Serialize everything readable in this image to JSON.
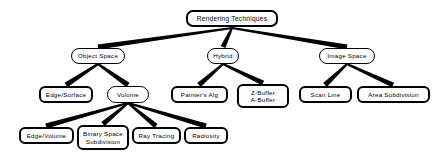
{
  "diagram": {
    "title": "Rendering Techniques",
    "type": "tree-hierarchy",
    "background_color": "#ffffff",
    "node_fill_color": "#ffffff",
    "node_border_color": "#000000",
    "edge_color": "#000000"
  },
  "nodes": {
    "root": {
      "label": "Rendering Techniques",
      "x": 186,
      "y": 10,
      "w": 92,
      "h": 17,
      "level": 0,
      "style": "root"
    },
    "object_space": {
      "label": "Object Space",
      "x": 71,
      "y": 48,
      "w": 54,
      "h": 16,
      "level": 1,
      "style": "thin"
    },
    "hybrid": {
      "label": "Hybrid",
      "x": 207,
      "y": 48,
      "w": 32,
      "h": 16,
      "level": 1,
      "style": "thin"
    },
    "image_space": {
      "label": "Image Space",
      "x": 319,
      "y": 48,
      "w": 56,
      "h": 16,
      "level": 1,
      "style": "thin"
    },
    "edge_surface": {
      "label": "Edge/Surface",
      "x": 39,
      "y": 86,
      "w": 54,
      "h": 17,
      "level": 2,
      "style": "leaf"
    },
    "volume": {
      "label": "Volume",
      "x": 107,
      "y": 86,
      "w": 42,
      "h": 17,
      "level": 2,
      "style": "thin"
    },
    "painters_alg": {
      "label": "Painter's Alg",
      "x": 171,
      "y": 86,
      "w": 57,
      "h": 17,
      "level": 2,
      "style": "leaf"
    },
    "z_buffer": {
      "label": "Z-Buffer\nA-Buffer",
      "x": 237,
      "y": 84,
      "w": 52,
      "h": 24,
      "level": 2,
      "style": "leaf"
    },
    "scan_line": {
      "label": "Scan Line",
      "x": 299,
      "y": 86,
      "w": 53,
      "h": 17,
      "level": 2,
      "style": "leaf"
    },
    "area_subdivision": {
      "label": "Area  Subdivision",
      "x": 357,
      "y": 86,
      "w": 73,
      "h": 17,
      "level": 2,
      "style": "leaf"
    },
    "edge_volume": {
      "label": "Edge/Volume",
      "x": 19,
      "y": 127,
      "w": 55,
      "h": 17,
      "level": 3,
      "style": "leaf"
    },
    "binary_space_subdivision": {
      "label": "Binary  Space\nSubdivision",
      "x": 77,
      "y": 125,
      "w": 52,
      "h": 25,
      "level": 3,
      "style": "leaf"
    },
    "ray_tracing": {
      "label": "Ray  Tracing",
      "x": 132,
      "y": 127,
      "w": 49,
      "h": 17,
      "level": 3,
      "style": "leaf"
    },
    "radiosity": {
      "label": "Radiosity",
      "x": 184,
      "y": 127,
      "w": 44,
      "h": 17,
      "level": 3,
      "style": "leaf"
    }
  },
  "edges": [
    {
      "from": "root",
      "to": "object_space",
      "fx": 232,
      "fy": 28,
      "tx": 98,
      "ty": 47
    },
    {
      "from": "root",
      "to": "hybrid",
      "fx": 232,
      "fy": 28,
      "tx": 223,
      "ty": 47
    },
    {
      "from": "root",
      "to": "image_space",
      "fx": 232,
      "fy": 28,
      "tx": 347,
      "ty": 47
    },
    {
      "from": "object_space",
      "to": "edge_surface",
      "fx": 98,
      "fy": 64,
      "tx": 66,
      "ty": 85
    },
    {
      "from": "object_space",
      "to": "volume",
      "fx": 98,
      "fy": 64,
      "tx": 128,
      "ty": 85
    },
    {
      "from": "hybrid",
      "to": "painters_alg",
      "fx": 223,
      "fy": 64,
      "tx": 199,
      "ty": 85
    },
    {
      "from": "hybrid",
      "to": "z_buffer",
      "fx": 223,
      "fy": 64,
      "tx": 263,
      "ty": 83
    },
    {
      "from": "image_space",
      "to": "scan_line",
      "fx": 347,
      "fy": 64,
      "tx": 325,
      "ty": 85
    },
    {
      "from": "image_space",
      "to": "area_subdivision",
      "fx": 347,
      "fy": 64,
      "tx": 393,
      "ty": 85
    },
    {
      "from": "volume",
      "to": "edge_volume",
      "fx": 128,
      "fy": 103,
      "tx": 46,
      "ty": 126
    },
    {
      "from": "volume",
      "to": "binary_space_subdivision",
      "fx": 128,
      "fy": 103,
      "tx": 103,
      "ty": 124
    },
    {
      "from": "volume",
      "to": "ray_tracing",
      "fx": 128,
      "fy": 103,
      "tx": 156,
      "ty": 126
    },
    {
      "from": "volume",
      "to": "radiosity",
      "fx": 128,
      "fy": 103,
      "tx": 206,
      "ty": 126
    }
  ]
}
